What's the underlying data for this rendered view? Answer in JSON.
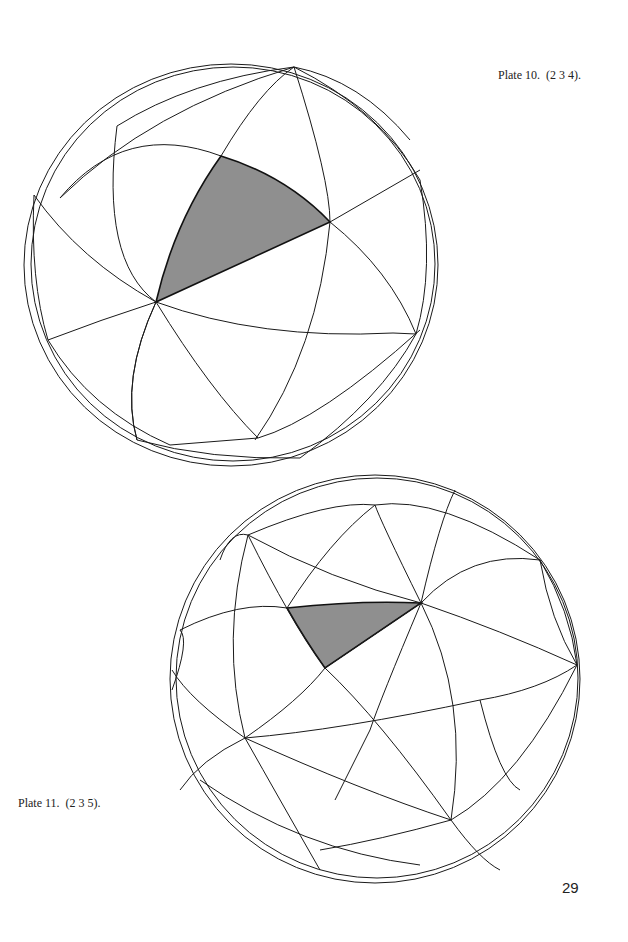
{
  "page": {
    "page_number": "29"
  },
  "plates": [
    {
      "caption": "Plate 10.  (2 3 4).",
      "group": "(2 3 4)",
      "description": "Sphere tessellated by great circles (octahedral 2-3-4 triangle group) with one fundamental spherical triangle shaded grey"
    },
    {
      "caption": "Plate 11.  (2 3 5).",
      "group": "(2 3 5)",
      "description": "Sphere tessellated by great circles (icosahedral 2-3-5 triangle group) with one fundamental spherical triangle shaded grey"
    }
  ],
  "colors": {
    "background": "#ffffff",
    "line": "#1a1a1a",
    "shade": "#8f8f8f"
  }
}
